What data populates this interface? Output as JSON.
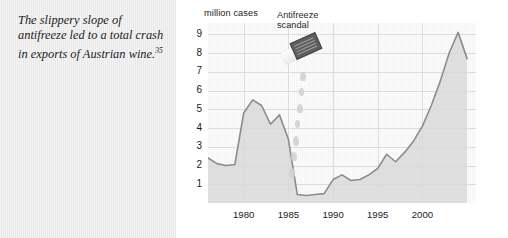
{
  "caption": {
    "text_line1": "The slippery slope of",
    "text_line2": "antifreeze led to a total",
    "text_line3": "crash in exports of Austrian",
    "text_line4": "wine.",
    "footnote_marker": "35"
  },
  "chart_data": {
    "type": "area",
    "title": "",
    "subtitle": "",
    "xlabel": "",
    "ylabel": "million cases",
    "ylim": [
      0,
      9.6
    ],
    "xlim": [
      1976,
      2006
    ],
    "grid": true,
    "legend": "none",
    "xticks": [
      "1980",
      "1985",
      "1990",
      "1995",
      "2000"
    ],
    "xtick_values": [
      1980,
      1985,
      1990,
      1995,
      2000
    ],
    "yticks": [
      "1",
      "2",
      "3",
      "4",
      "5",
      "6",
      "7",
      "8",
      "9"
    ],
    "ytick_values": [
      1,
      2,
      3,
      4,
      5,
      6,
      7,
      8,
      9
    ],
    "series": [
      {
        "name": "Austrian wine exports",
        "x": [
          1976,
          1977,
          1978,
          1979,
          1980,
          1981,
          1982,
          1983,
          1984,
          1985,
          1986,
          1987,
          1988,
          1989,
          1990,
          1991,
          1992,
          1993,
          1994,
          1995,
          1996,
          1997,
          1998,
          1999,
          2000,
          2001,
          2002,
          2003,
          2004,
          2005
        ],
        "values": [
          2.4,
          2.1,
          2.0,
          2.05,
          4.8,
          5.5,
          5.2,
          4.2,
          4.7,
          3.4,
          0.45,
          0.4,
          0.45,
          0.5,
          1.25,
          1.5,
          1.2,
          1.25,
          1.5,
          1.85,
          2.6,
          2.2,
          2.7,
          3.3,
          4.1,
          5.2,
          6.5,
          8.0,
          9.1,
          7.7
        ]
      }
    ],
    "annotations": [
      {
        "name": "antifreeze-scandal",
        "label_line1": "Antifreeze",
        "label_line2": "scandal",
        "x_value": 1985,
        "icon": "antifreeze-bottle-icon"
      }
    ],
    "colors": {
      "line": "#8c8c8c",
      "fill": "#d9d9d9",
      "grid": "#dcdcdc",
      "plot_background": "#fbfbfb",
      "caption_background": "#e8e8e8",
      "text": "#1b1b1b"
    }
  }
}
